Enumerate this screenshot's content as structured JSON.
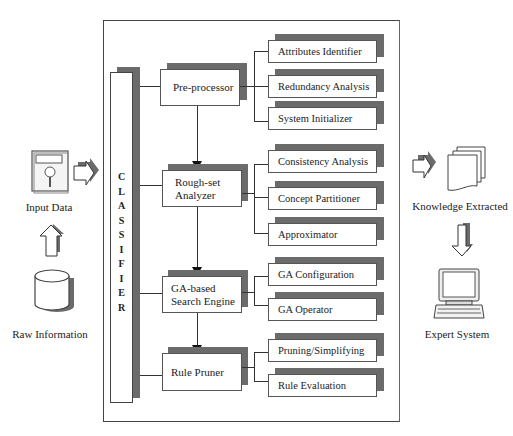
{
  "diagram": {
    "left": {
      "input_data": {
        "label": "Input Data",
        "icon": "floppy-disk-icon"
      },
      "raw_information": {
        "label": "Raw Information",
        "icon": "database-cylinder-icon"
      }
    },
    "right": {
      "knowledge_extracted": {
        "label": "Knowledge Extracted",
        "icon": "document-stack-icon"
      },
      "expert_system": {
        "label": "Expert System",
        "icon": "computer-terminal-icon"
      }
    },
    "classifier": {
      "label": "CLASSIFIER",
      "letters": [
        "C",
        "L",
        "A",
        "S",
        "S",
        "I",
        "F",
        "I",
        "E",
        "R"
      ]
    },
    "stages": [
      {
        "label_line1": "Pre-processor",
        "label_line2": "",
        "subcomponents": [
          "Attributes Identifier",
          "Redundancy Analysis",
          "System Initializer"
        ]
      },
      {
        "label_line1": "Rough-set",
        "label_line2": "Analyzer",
        "subcomponents": [
          "Consistency Analysis",
          "Concept Partitioner",
          "Approximator"
        ]
      },
      {
        "label_line1": "GA-based",
        "label_line2": "Search Engine",
        "subcomponents": [
          "GA Configuration",
          "GA Operator"
        ]
      },
      {
        "label_line1": "Rule Pruner",
        "label_line2": "",
        "subcomponents": [
          "Pruning/Simplifying",
          "Rule Evaluation"
        ]
      }
    ],
    "colors": {
      "shadow": "#6b6b6b",
      "border": "#555555",
      "background": "#ffffff"
    }
  }
}
